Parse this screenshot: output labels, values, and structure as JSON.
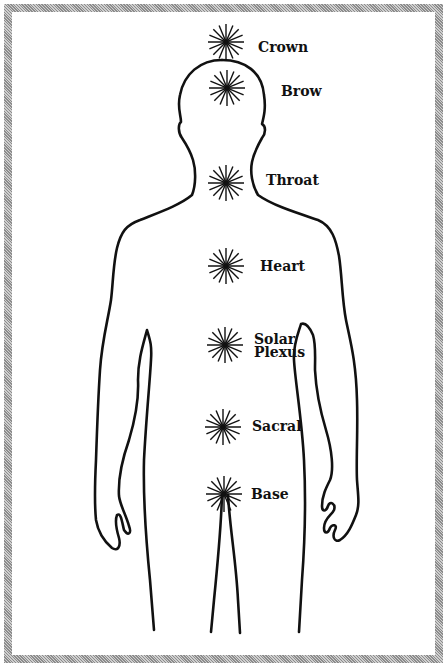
{
  "figure": {
    "border_color": "#a8a8a8",
    "line_color": "#111111"
  },
  "chakras": [
    {
      "name": "Crown",
      "lines": [
        "Crown"
      ],
      "cx": 226,
      "cy": 42,
      "label_x": 258,
      "label_y": 41
    },
    {
      "name": "Brow",
      "lines": [
        "Brow"
      ],
      "cx": 227,
      "cy": 88,
      "label_x": 281,
      "label_y": 85
    },
    {
      "name": "Throat",
      "lines": [
        "Throat"
      ],
      "cx": 226,
      "cy": 183,
      "label_x": 266,
      "label_y": 174
    },
    {
      "name": "Heart",
      "lines": [
        "Heart"
      ],
      "cx": 226,
      "cy": 266,
      "label_x": 260,
      "label_y": 260
    },
    {
      "name": "Solar Plexus",
      "lines": [
        "Solar",
        "Plexus"
      ],
      "cx": 225,
      "cy": 345,
      "label_x": 254,
      "label_y": 333
    },
    {
      "name": "Sacral",
      "lines": [
        "Sacral"
      ],
      "cx": 223,
      "cy": 427,
      "label_x": 252,
      "label_y": 420
    },
    {
      "name": "Base",
      "lines": [
        "Base"
      ],
      "cx": 224,
      "cy": 494,
      "label_x": 251,
      "label_y": 488
    }
  ]
}
